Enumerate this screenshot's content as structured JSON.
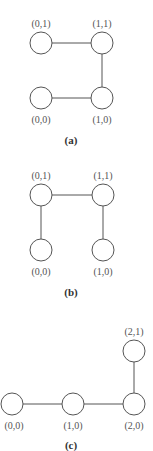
{
  "panels": [
    {
      "caption": "(a)",
      "nodes": [
        {
          "label": "(0,1)",
          "x": 41,
          "y": 43,
          "label_pos": "above"
        },
        {
          "label": "(1,1)",
          "x": 102,
          "y": 43,
          "label_pos": "above"
        },
        {
          "label": "(0,0)",
          "x": 41,
          "y": 98,
          "label_pos": "below"
        },
        {
          "label": "(1,0)",
          "x": 102,
          "y": 98,
          "label_pos": "below"
        }
      ],
      "edges": [
        [
          "(0,1)",
          "(1,1)"
        ],
        [
          "(1,1)",
          "(1,0)"
        ],
        [
          "(0,0)",
          "(1,0)"
        ]
      ]
    },
    {
      "caption": "(b)",
      "nodes": [
        {
          "label": "(0,1)",
          "x": 41,
          "y": 195,
          "label_pos": "above"
        },
        {
          "label": "(1,1)",
          "x": 103,
          "y": 195,
          "label_pos": "above"
        },
        {
          "label": "(0,0)",
          "x": 41,
          "y": 250,
          "label_pos": "below"
        },
        {
          "label": "(1,0)",
          "x": 103,
          "y": 250,
          "label_pos": "below"
        }
      ],
      "edges": [
        [
          "(0,1)",
          "(1,1)"
        ],
        [
          "(0,1)",
          "(0,0)"
        ],
        [
          "(1,1)",
          "(1,0)"
        ]
      ]
    },
    {
      "caption": "(c)",
      "nodes": [
        {
          "label": "(2,1)",
          "x": 134,
          "y": 351,
          "label_pos": "above"
        },
        {
          "label": "(0,0)",
          "x": 12,
          "y": 404,
          "label_pos": "below"
        },
        {
          "label": "(1,0)",
          "x": 73,
          "y": 404,
          "label_pos": "below"
        },
        {
          "label": "(2,0)",
          "x": 134,
          "y": 404,
          "label_pos": "below"
        }
      ],
      "edges": [
        [
          "(0,0)",
          "(1,0)"
        ],
        [
          "(1,0)",
          "(2,0)"
        ],
        [
          "(2,0)",
          "(2,1)"
        ]
      ]
    }
  ]
}
